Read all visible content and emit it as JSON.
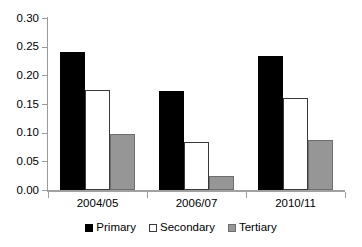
{
  "chart_data": {
    "type": "bar",
    "title": "",
    "subtitle": "",
    "xlabel": "",
    "ylabel": "",
    "categories": [
      "2004/05",
      "2006/07",
      "2010/11"
    ],
    "series": [
      {
        "name": "Primary",
        "color": "#000000",
        "values": [
          0.24,
          0.172,
          0.233
        ]
      },
      {
        "name": "Secondary",
        "color": "#ffffff",
        "values": [
          0.175,
          0.083,
          0.161
        ]
      },
      {
        "name": "Tertiary",
        "color": "#969696",
        "values": [
          0.097,
          0.024,
          0.087
        ]
      }
    ],
    "ylim": [
      0.0,
      0.3
    ],
    "ytick_values": [
      0.0,
      0.05,
      0.1,
      0.15,
      0.2,
      0.25,
      0.3
    ],
    "ytick_labels": [
      "0.00",
      "0.05",
      "0.10",
      "0.15",
      "0.20",
      "0.25",
      "0.30"
    ],
    "grid": false,
    "legend_position": "bottom-center",
    "legend_entries": [
      "Primary",
      "Secondary",
      "Tertiary"
    ]
  },
  "axis": {
    "y_labels": [
      "0.30",
      "0.25",
      "0.20",
      "0.15",
      "0.10",
      "0.05",
      "0.00"
    ],
    "x_labels": [
      "2004/05",
      "2006/07",
      "2010/11"
    ]
  },
  "legend": {
    "items": [
      {
        "label": "Primary",
        "swatch": "black-square-icon"
      },
      {
        "label": "Secondary",
        "swatch": "white-square-icon"
      },
      {
        "label": "Tertiary",
        "swatch": "gray-square-icon"
      }
    ]
  }
}
